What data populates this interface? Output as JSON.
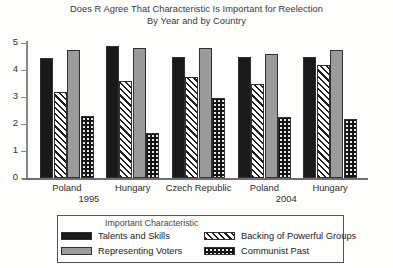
{
  "title": {
    "line1": "Does R Agree That Characteristic Is Important for Reelection",
    "line2": "By Year and by Country"
  },
  "legend": {
    "title": "Important Characteristic",
    "entries": [
      {
        "label": "Talents and Skills",
        "swatch": "solid-black-swatch"
      },
      {
        "label": "Backing of Powerful Groups",
        "swatch": "diagonal-hatch-swatch"
      },
      {
        "label": "Representing Voters",
        "swatch": "solid-gray-swatch"
      },
      {
        "label": "Communist Past",
        "swatch": "dotted-black-swatch"
      }
    ]
  },
  "axis": {
    "y_ticks": [
      "0",
      "1",
      "2",
      "3",
      "4",
      "5"
    ]
  },
  "groups": [
    {
      "country": "Poland",
      "period": "1995"
    },
    {
      "country": "Hungary",
      "period": ""
    },
    {
      "country": "Czech Republic",
      "period": ""
    },
    {
      "country": "Poland",
      "period": "2004"
    },
    {
      "country": "Hungary",
      "period": ""
    }
  ],
  "chart_data": {
    "type": "bar",
    "title": "Does R Agree That Characteristic Is Important for Reelection By Year and by Country",
    "xlabel": "",
    "ylabel": "",
    "ylim": [
      0,
      5
    ],
    "yticks": [
      0,
      1,
      2,
      3,
      4,
      5
    ],
    "grid": false,
    "legend_title": "Important Characteristic",
    "legend_position": "below-plot",
    "categories": [
      "Poland 1995",
      "Hungary 1995",
      "Czech Republic 1995",
      "Poland 2004",
      "Hungary 2004"
    ],
    "group_periods": [
      "1995",
      "1995",
      "1995",
      "2004",
      "2004"
    ],
    "series": [
      {
        "name": "Talents and Skills",
        "values": [
          4.45,
          4.9,
          4.5,
          4.5,
          4.5
        ]
      },
      {
        "name": "Backing of Powerful Groups",
        "values": [
          3.2,
          3.6,
          3.75,
          3.5,
          4.2
        ]
      },
      {
        "name": "Representing Voters",
        "values": [
          4.75,
          4.8,
          4.8,
          4.6,
          4.75
        ]
      },
      {
        "name": "Communist Past",
        "values": [
          2.3,
          1.65,
          2.95,
          2.25,
          2.2
        ]
      }
    ]
  }
}
